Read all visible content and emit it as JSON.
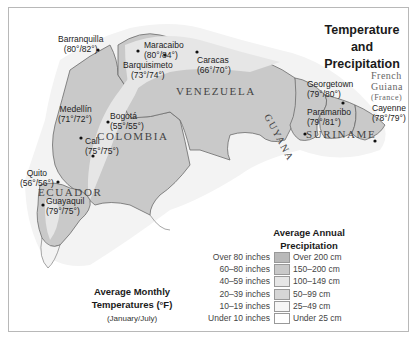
{
  "title": "Temperature and Precipitation",
  "title_lines": [
    "Temperature and",
    "Precipitation"
  ],
  "countries": [
    {
      "name": "VENEZUELA"
    },
    {
      "name": "COLOMBIA"
    },
    {
      "name": "ECUADOR"
    },
    {
      "name": "GUYANA"
    },
    {
      "name": "SURINAME"
    }
  ],
  "french_guiana": {
    "line1": "French",
    "line2": "Guiana",
    "line3": "(France)"
  },
  "cities": [
    {
      "name": "Barranquilla",
      "temps": "(80°/82°)"
    },
    {
      "name": "Maracaibo",
      "temps": "(80°/84°)"
    },
    {
      "name": "Barquisimeto",
      "temps": "(73°/74°)"
    },
    {
      "name": "Caracas",
      "temps": "(66°/70°)"
    },
    {
      "name": "Medellín",
      "temps": "(71°/72°)"
    },
    {
      "name": "Bogotá",
      "temps": "(55°/55°)"
    },
    {
      "name": "Cali",
      "temps": "(75°/75°)"
    },
    {
      "name": "Quito",
      "temps": "(56°/56°)"
    },
    {
      "name": "Guayaquil",
      "temps": "(79°/75°)"
    },
    {
      "name": "Georgetown",
      "temps": "(79°/80°)"
    },
    {
      "name": "Paramaribo",
      "temps": "(79°/81°)"
    },
    {
      "name": "Cayenne",
      "temps": "(78°/79°)"
    }
  ],
  "temperature_note": {
    "heading_line1": "Average Monthly",
    "heading_line2": "Temperatures (°F)",
    "sub": "(January/July)"
  },
  "legend": {
    "heading_line1": "Average Annual",
    "heading_line2": "Precipitation",
    "rows": [
      {
        "inches": "Over 80 inches",
        "cm": "Over 200 cm",
        "color": "#b9b9b9"
      },
      {
        "inches": "60–80 inches",
        "cm": "150–200 cm",
        "color": "#c9c9c9"
      },
      {
        "inches": "40–59 inches",
        "cm": "100–149 cm",
        "color": "#e6e6e6"
      },
      {
        "inches": "20–39 inches",
        "cm": "50–99 cm",
        "color": "#d6d6d6"
      },
      {
        "inches": "10–19 inches",
        "cm": "25–49 cm",
        "color": "#f6f6f6"
      },
      {
        "inches": "Under 10 inches",
        "cm": "Under 25 cm",
        "color": "#ffffff"
      }
    ]
  },
  "colors": {
    "wettest": "#b9b9b9",
    "wet": "#c9c9c9",
    "moderate": "#e6e6e6",
    "semi": "#d6d6d6",
    "dry": "#f3f3f3",
    "border": "#6b6b6b"
  }
}
